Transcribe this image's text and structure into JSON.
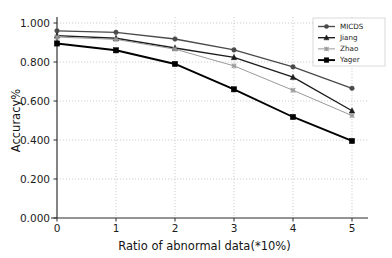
{
  "chart_data": {
    "type": "line",
    "title": "",
    "xlabel": "Ratio of abnormal data(*10%)",
    "ylabel": "Accuracy%",
    "x": [
      0,
      1,
      2,
      3,
      4,
      5
    ],
    "xtick_labels": [
      "0",
      "1",
      "2",
      "3",
      "4",
      "5"
    ],
    "ytick_labels": [
      "0.000",
      "0.200",
      "0.400",
      "0.600",
      "0.800",
      "1.000"
    ],
    "ytick_values": [
      0.0,
      0.2,
      0.4,
      0.6,
      0.8,
      1.0
    ],
    "xlim": [
      0,
      5
    ],
    "ylim": [
      0.0,
      1.0
    ],
    "grid": true,
    "legend_position": "upper right",
    "series": [
      {
        "name": "MICDS",
        "marker": "circle",
        "color": "#4a4a4a",
        "values": [
          0.96,
          0.952,
          0.918,
          0.862,
          0.775,
          0.665
        ]
      },
      {
        "name": "Jiang",
        "marker": "triangle",
        "color": "#1c1c1c",
        "values": [
          0.935,
          0.922,
          0.872,
          0.824,
          0.722,
          0.55
        ]
      },
      {
        "name": "Zhao",
        "marker": "x",
        "color": "#9a9a9a",
        "values": [
          0.928,
          0.916,
          0.866,
          0.78,
          0.655,
          0.525
        ]
      },
      {
        "name": "Yager",
        "marker": "square",
        "color": "#000000",
        "values": [
          0.895,
          0.86,
          0.79,
          0.66,
          0.518,
          0.395
        ]
      }
    ]
  },
  "legend": {
    "entries": [
      {
        "label": "MICDS"
      },
      {
        "label": "Jiang"
      },
      {
        "label": "Zhao"
      },
      {
        "label": "Yager"
      }
    ]
  },
  "colors": {
    "background": "#ffffff",
    "axis": "#2b2b2b",
    "grid": "#b9b9b9",
    "text": "#1c1c1c"
  }
}
